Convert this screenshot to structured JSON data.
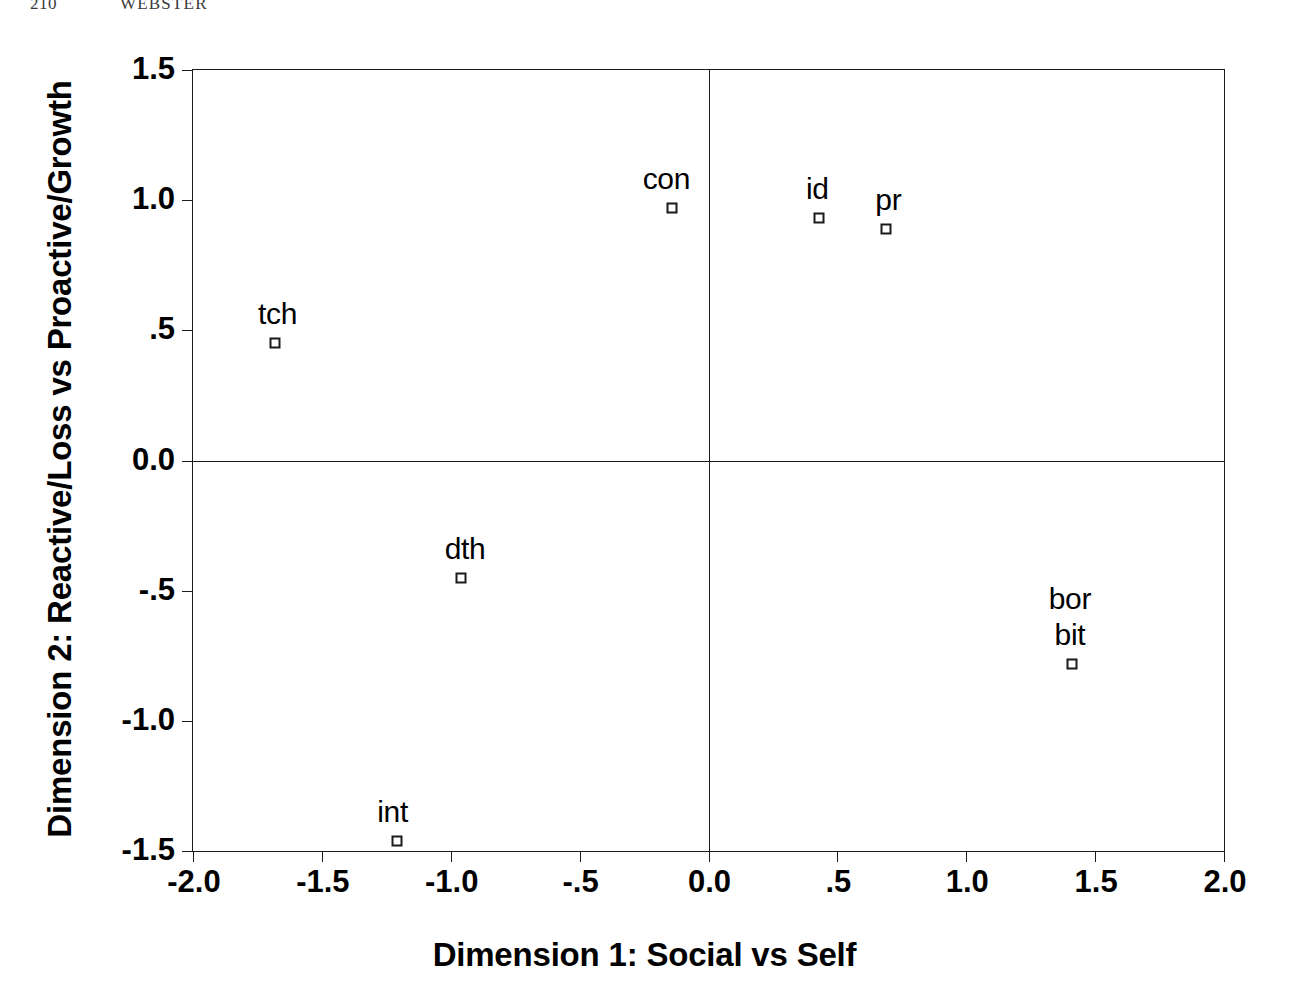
{
  "running_head": {
    "folio": "210",
    "title": "WEBSTER"
  },
  "chart_data": {
    "type": "scatter",
    "title": "",
    "xlabel": "Dimension 1: Social vs Self",
    "ylabel": "Dimension 2: Reactive/Loss vs Proactive/Growth",
    "xlim": [
      -2.0,
      2.0
    ],
    "ylim": [
      -1.5,
      1.5
    ],
    "grid": false,
    "legend": "none",
    "marker": "open-square",
    "xticks": [
      "-2.0",
      "-1.5",
      "-1.0",
      "-.5",
      "0.0",
      ".5",
      "1.0",
      "1.5",
      "2.0"
    ],
    "xtick_values": [
      -2.0,
      -1.5,
      -1.0,
      -0.5,
      0.0,
      0.5,
      1.0,
      1.5,
      2.0
    ],
    "yticks": [
      "1.5",
      "1.0",
      ".5",
      "0.0",
      "-.5",
      "-1.0",
      "-1.5"
    ],
    "ytick_values": [
      1.5,
      1.0,
      0.5,
      0.0,
      -0.5,
      -1.0,
      -1.5
    ],
    "points": [
      {
        "label": "con",
        "x": -0.14,
        "y": 0.97,
        "label_dx": -6,
        "label_dy": -46
      },
      {
        "label": "id",
        "x": 0.43,
        "y": 0.93,
        "label_dx": -2,
        "label_dy": -46
      },
      {
        "label": "pr",
        "x": 0.69,
        "y": 0.89,
        "label_dx": 2,
        "label_dy": -46
      },
      {
        "label": "tch",
        "x": -1.68,
        "y": 0.45,
        "label_dx": 2,
        "label_dy": -46
      },
      {
        "label": "dth",
        "x": -0.96,
        "y": -0.45,
        "label_dx": 4,
        "label_dy": -46
      },
      {
        "label": "bor",
        "x": 1.41,
        "y": -0.78,
        "label_dx": -2,
        "label_dy": -82,
        "marker": false
      },
      {
        "label": "bit",
        "x": 1.41,
        "y": -0.78,
        "label_dx": -2,
        "label_dy": -46
      },
      {
        "label": "int",
        "x": -1.21,
        "y": -1.46,
        "label_dx": -4,
        "label_dy": -46
      }
    ]
  }
}
